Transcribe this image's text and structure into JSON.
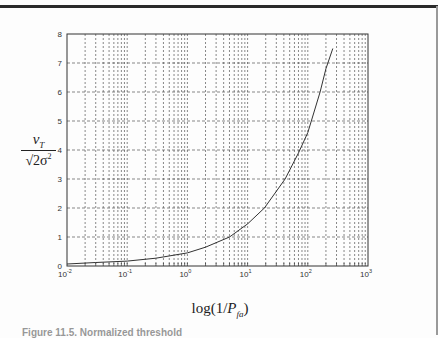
{
  "chart_data": {
    "type": "line",
    "title": "",
    "xlabel": "log(1/P_fa)",
    "ylabel": "v_T / sqrt(2σ^2)",
    "xscale": "log",
    "xlim": [
      0.01,
      1000
    ],
    "ylim": [
      0,
      8
    ],
    "grid": true,
    "grid_style": "dotted major and minor",
    "x_tick_labels": [
      "10^-2",
      "10^-1",
      "10^0",
      "10^1",
      "10^2",
      "10^3"
    ],
    "y_tick_labels": [
      "0",
      "1",
      "2",
      "3",
      "4",
      "5",
      "6",
      "7",
      "8"
    ],
    "series": [
      {
        "name": "normalized threshold",
        "x": [
          0.01,
          0.03,
          0.1,
          0.3,
          1,
          2,
          5,
          10,
          19,
          42,
          70,
          100,
          160,
          200,
          260
        ],
        "y": [
          0.07,
          0.12,
          0.17,
          0.27,
          0.45,
          0.65,
          1.0,
          1.45,
          2.0,
          3.0,
          3.9,
          4.6,
          6.0,
          6.8,
          7.5
        ]
      }
    ],
    "legend": null
  },
  "labels": {
    "ylabel_num": "v",
    "ylabel_num_sub": "T",
    "ylabel_den": "√2σ",
    "ylabel_den_sup": "2",
    "xlabel_pre": "log(1/",
    "xlabel_var": "P",
    "xlabel_sub": "fa",
    "xlabel_post": ")",
    "caption": "Figure 11.5. Normalized threshold"
  }
}
